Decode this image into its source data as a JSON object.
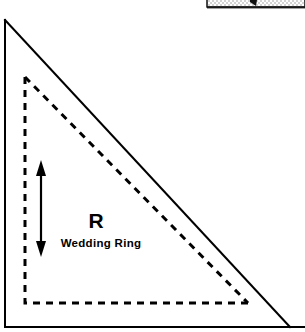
{
  "figure": {
    "canvas": {
      "width": 305,
      "height": 332,
      "background_color": "#ffffff",
      "ink_color": "#000000"
    },
    "labels": {
      "block_code": "R",
      "block_name": "Wedding Ring"
    },
    "frame": {
      "name": "outer-frame",
      "left_x": 5,
      "bottom_y": 327,
      "stroke_width": 2
    },
    "solid_triangle": {
      "name": "cut-piece-outline",
      "style": "solid",
      "stroke_width": 2,
      "points": "5,20 5,327 290,327",
      "apex": [
        5,
        20
      ],
      "bottom_left": [
        5,
        327
      ],
      "bottom_right": [
        290,
        327
      ]
    },
    "dashed_triangle": {
      "name": "seam-allowance-line",
      "style": "dashed",
      "stroke_width": 3,
      "dash_pattern": "7 6",
      "points": "25,77 25,303 248,303",
      "apex": [
        25,
        77
      ],
      "bottom_left": [
        25,
        303
      ],
      "bottom_right": [
        248,
        303
      ]
    },
    "dimension_arrow": {
      "name": "height-dimension-arrow",
      "orientation": "vertical",
      "double_headed": true,
      "x": 41,
      "y_top": 162,
      "y_bottom": 256,
      "stroke_width": 2
    },
    "top_fragment": {
      "name": "cropped-figure-above",
      "description": "stippled strip",
      "x": 207,
      "y": 0,
      "width": 98,
      "height": 9
    }
  }
}
